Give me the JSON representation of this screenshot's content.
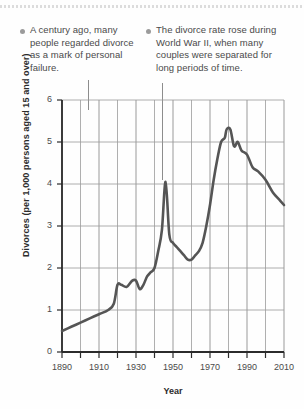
{
  "chart_data": {
    "type": "line",
    "title": "",
    "xlabel": "Year",
    "ylabel": "Divorces (per 1,000 persons aged 15 and over)",
    "xlim": [
      1890,
      2010
    ],
    "ylim": [
      0,
      6
    ],
    "grid": true,
    "legend": "none",
    "x_ticks_major": [
      1890,
      1910,
      1930,
      1950,
      1970,
      1990,
      2010
    ],
    "x_ticks_minor": [
      1900,
      1920,
      1940,
      1960,
      1980,
      2000
    ],
    "y_ticks": [
      0,
      1,
      2,
      3,
      4,
      5,
      6
    ],
    "x_tick_labels": [
      "1890",
      "1910",
      "1930",
      "1950",
      "1970",
      "1990",
      "2010"
    ],
    "y_tick_labels": [
      "0",
      "1",
      "2",
      "3",
      "4",
      "5",
      "6"
    ],
    "series": [
      {
        "name": "Divorce rate",
        "color": "#555555",
        "x": [
          1890,
          1895,
          1900,
          1905,
          1910,
          1915,
          1918,
          1920,
          1922,
          1925,
          1928,
          1930,
          1932,
          1934,
          1936,
          1938,
          1940,
          1942,
          1944,
          1946,
          1948,
          1950,
          1952,
          1954,
          1956,
          1958,
          1960,
          1962,
          1964,
          1966,
          1968,
          1970,
          1972,
          1974,
          1976,
          1978,
          1979,
          1981,
          1983,
          1985,
          1987,
          1990,
          1993,
          1996,
          2000,
          2004,
          2008,
          2010
        ],
        "y": [
          0.5,
          0.6,
          0.7,
          0.8,
          0.9,
          1.0,
          1.15,
          1.6,
          1.6,
          1.55,
          1.7,
          1.7,
          1.5,
          1.6,
          1.8,
          1.9,
          2.0,
          2.4,
          2.9,
          4.05,
          2.8,
          2.6,
          2.5,
          2.4,
          2.3,
          2.2,
          2.2,
          2.3,
          2.4,
          2.6,
          3.0,
          3.5,
          4.1,
          4.6,
          5.0,
          5.1,
          5.3,
          5.3,
          4.9,
          5.0,
          4.8,
          4.7,
          4.4,
          4.3,
          4.1,
          3.8,
          3.6,
          3.5
        ]
      }
    ],
    "annotations": [
      {
        "id": "annotation-century-ago",
        "text": "A century ago, many people regarded divorce as a mark of personal failure.",
        "points_to_year": 1900
      },
      {
        "id": "annotation-world-war-two",
        "text": "The divorce rate rose during World War II, when many couples were separated for long periods of time.",
        "points_to_year": 1946
      }
    ]
  }
}
